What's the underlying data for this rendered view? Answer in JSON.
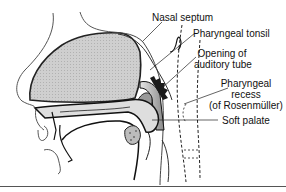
{
  "figure": {
    "labels": [
      {
        "id": "nasal-septum",
        "text": "Nasal septum"
      },
      {
        "id": "pharyngeal-tonsil",
        "text": "Pharyngeal tonsil"
      },
      {
        "id": "opening-auditory-tube",
        "lines": [
          "Opening of",
          "auditory tube"
        ]
      },
      {
        "id": "pharyngeal-recess",
        "lines": [
          "Pharyngeal",
          "recess",
          "(of Rosenmüller)"
        ]
      },
      {
        "id": "soft-palate",
        "text": "Soft palate"
      }
    ],
    "colors": {
      "fill_gray": "#c9c9c9",
      "line": "#1a1a1a",
      "dark": "#222222"
    }
  }
}
